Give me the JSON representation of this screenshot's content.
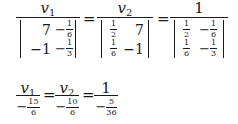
{
  "equation1": {
    "fractions": [
      {
        "numerator": {
          "var": "v",
          "sub": "1"
        },
        "matrix": [
          [
            {
              "text": "7"
            },
            {
              "sign": "−",
              "n": "1",
              "d": "6"
            }
          ],
          [
            {
              "text": "−1"
            },
            {
              "sign": "−",
              "n": "1",
              "d": "3"
            }
          ]
        ]
      },
      {
        "numerator": {
          "var": "v",
          "sub": "2"
        },
        "matrix": [
          [
            {
              "sign": "",
              "n": "1",
              "d": "2"
            },
            {
              "text": "7"
            }
          ],
          [
            {
              "sign": "",
              "n": "1",
              "d": "6"
            },
            {
              "text": "−1"
            }
          ]
        ]
      },
      {
        "numerator": {
          "text": "1"
        },
        "matrix": [
          [
            {
              "sign": "",
              "n": "1",
              "d": "2"
            },
            {
              "sign": "−",
              "n": "1",
              "d": "6"
            }
          ],
          [
            {
              "sign": "",
              "n": "1",
              "d": "6"
            },
            {
              "sign": "−",
              "n": "1",
              "d": "3"
            }
          ]
        ]
      }
    ],
    "equals": "="
  },
  "equation2": {
    "fractions": [
      {
        "numerator": {
          "var": "v",
          "sub": "1"
        },
        "denominator": {
          "sign": "−",
          "n": "15",
          "d": "6"
        }
      },
      {
        "numerator": {
          "var": "v",
          "sub": "2"
        },
        "denominator": {
          "sign": "−",
          "n": "10",
          "d": "6"
        }
      },
      {
        "numerator": {
          "text": "1"
        },
        "denominator": {
          "sign": "−",
          "n": "5",
          "d": "36"
        }
      }
    ],
    "equals": "="
  }
}
